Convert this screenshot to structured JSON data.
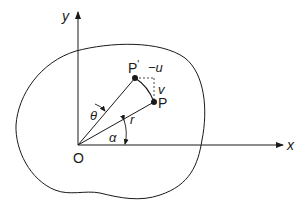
{
  "diagram": {
    "axes": {
      "x_label": "x",
      "y_label": "y",
      "origin_label": "O"
    },
    "points": {
      "p_label": "P",
      "p_prime_label": "P'",
      "prime_mark": "'"
    },
    "labels": {
      "radius": "r",
      "theta": "θ",
      "alpha": "α",
      "u_displacement": "−u",
      "v_displacement": "v"
    },
    "colors": {
      "stroke": "#1a1a1a",
      "background": "#ffffff"
    }
  }
}
